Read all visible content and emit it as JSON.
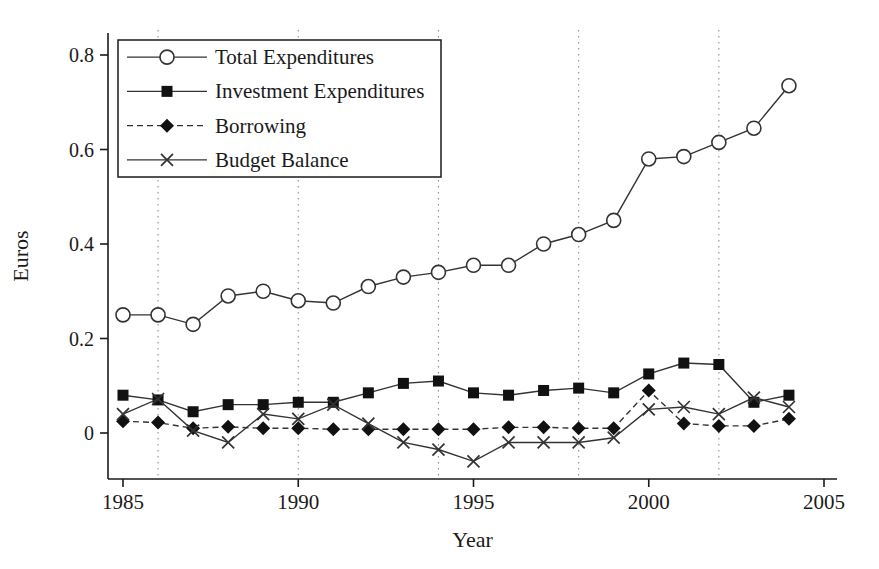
{
  "figure": {
    "background": "#ffffff"
  },
  "chart_data": {
    "type": "line",
    "title": "",
    "xlabel": "Year",
    "ylabel": "Euros",
    "x_ticks": [
      1985,
      1990,
      1995,
      2000,
      2005
    ],
    "x_tick_labels": [
      "1985",
      "1990",
      "1995",
      "2000",
      "2005"
    ],
    "y_ticks": [
      0,
      0.2,
      0.4,
      0.6,
      0.8
    ],
    "y_tick_labels": [
      "0",
      "0.2",
      "0.4",
      "0.6",
      "0.8"
    ],
    "xlim": [
      1984.6,
      2005.4
    ],
    "ylim": [
      -0.097,
      0.846
    ],
    "grid": "vertical-dotted",
    "gridlines_x": [
      1986,
      1990,
      1994,
      1998,
      2002
    ],
    "legend_position": "top-left",
    "x": [
      1985,
      1986,
      1987,
      1988,
      1989,
      1990,
      1991,
      1992,
      1993,
      1994,
      1995,
      1996,
      1997,
      1998,
      1999,
      2000,
      2001,
      2002,
      2003,
      2004
    ],
    "series": [
      {
        "name": "Total Expenditures",
        "marker": "circle-open",
        "line": "solid",
        "values": [
          0.25,
          0.25,
          0.23,
          0.29,
          0.3,
          0.28,
          0.275,
          0.31,
          0.33,
          0.34,
          0.355,
          0.355,
          0.4,
          0.42,
          0.45,
          0.58,
          0.585,
          0.615,
          0.645,
          0.735
        ]
      },
      {
        "name": "Investment Expenditures",
        "marker": "square-filled",
        "line": "solid",
        "values": [
          0.08,
          0.07,
          0.045,
          0.06,
          0.06,
          0.065,
          0.065,
          0.085,
          0.105,
          0.11,
          0.085,
          0.08,
          0.09,
          0.095,
          0.085,
          0.125,
          0.148,
          0.145,
          0.065,
          0.08
        ]
      },
      {
        "name": "Borrowing",
        "marker": "diamond-filled",
        "line": "dashed",
        "values": [
          0.025,
          0.022,
          0.01,
          0.013,
          0.01,
          0.01,
          0.008,
          0.008,
          0.008,
          0.008,
          0.008,
          0.012,
          0.012,
          0.01,
          0.01,
          0.09,
          0.02,
          0.015,
          0.015,
          0.03
        ]
      },
      {
        "name": "Budget Balance",
        "marker": "x",
        "line": "solid",
        "values": [
          0.04,
          0.072,
          0.005,
          -0.02,
          0.04,
          0.03,
          0.06,
          0.02,
          -0.02,
          -0.035,
          -0.06,
          -0.02,
          -0.02,
          -0.02,
          -0.01,
          0.05,
          0.055,
          0.04,
          0.075,
          0.055
        ]
      }
    ],
    "colors": {
      "line": "#333333",
      "marker_fill": "#111111",
      "marker_open_fill": "#ffffff",
      "axis": "#1a1a1a",
      "grid": "#8c8c8c",
      "background": "#ffffff"
    }
  }
}
